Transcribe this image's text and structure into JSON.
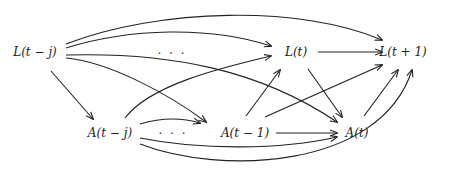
{
  "nodes": {
    "L_tj": "L(t − j)",
    "L_t": "L(t)",
    "L_t1": "L(t + 1)",
    "A_tj": "A(t − j)",
    "A_t1": "A(t − 1)",
    "A_t": "A(t)",
    "dots_top": "· · ·",
    "dots_bottom": "· · ·"
  },
  "edges": [
    {
      "from": "L(t − j)",
      "to": "L(t + 1)"
    },
    {
      "from": "L(t − j)",
      "to": "L(t)"
    },
    {
      "from": "L(t − j)",
      "to": "A(t)"
    },
    {
      "from": "L(t − j)",
      "to": "A(t − 1)"
    },
    {
      "from": "L(t − j)",
      "to": "A(t − j)"
    },
    {
      "from": "A(t − j)",
      "to": "L(t)"
    },
    {
      "from": "A(t − j)",
      "to": "A(t − 1)"
    },
    {
      "from": "A(t − j)",
      "to": "A(t)"
    },
    {
      "from": "A(t − j)",
      "to": "L(t + 1)"
    },
    {
      "from": "A(t − 1)",
      "to": "L(t)"
    },
    {
      "from": "A(t − 1)",
      "to": "L(t + 1)"
    },
    {
      "from": "A(t − 1)",
      "to": "A(t)"
    },
    {
      "from": "L(t)",
      "to": "L(t + 1)"
    },
    {
      "from": "L(t)",
      "to": "A(t)"
    },
    {
      "from": "A(t)",
      "to": "L(t + 1)"
    }
  ]
}
